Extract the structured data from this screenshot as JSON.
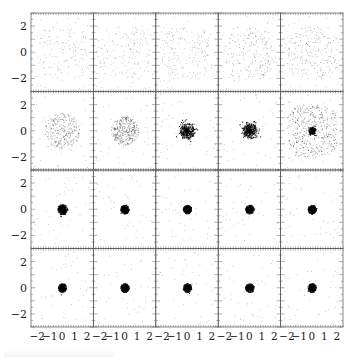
{
  "chart_data": {
    "type": "scatter",
    "layout": {
      "rows": 4,
      "cols": 5,
      "shared_axes": true
    },
    "xlim": [
      -2.5,
      2.5
    ],
    "ylim": [
      -3,
      3
    ],
    "xticks": [
      -2,
      -1,
      0,
      1,
      2
    ],
    "yticks": [
      -2,
      0,
      2
    ],
    "xtick_labels": [
      "−2",
      "−1",
      "0",
      "1",
      "2"
    ],
    "ytick_labels": [
      "−2",
      "0",
      "2"
    ],
    "title": "",
    "xlabel": "",
    "ylabel": "",
    "grid": false,
    "point_color": "#000000",
    "panels": [
      {
        "row": 0,
        "col": 0,
        "spread": 2.0,
        "core": 0.0,
        "density": 0.25
      },
      {
        "row": 0,
        "col": 1,
        "spread": 2.0,
        "core": 0.0,
        "density": 0.28
      },
      {
        "row": 0,
        "col": 2,
        "spread": 2.0,
        "core": 0.0,
        "density": 0.32
      },
      {
        "row": 0,
        "col": 3,
        "spread": 2.0,
        "core": 0.0,
        "density": 0.42
      },
      {
        "row": 0,
        "col": 4,
        "spread": 2.0,
        "core": 0.0,
        "density": 0.45
      },
      {
        "row": 1,
        "col": 0,
        "spread": 1.4,
        "core": 0.0,
        "density": 0.6
      },
      {
        "row": 1,
        "col": 1,
        "spread": 1.1,
        "core": 0.0,
        "density": 0.7
      },
      {
        "row": 1,
        "col": 2,
        "spread": 0.6,
        "core": 0.3,
        "density": 0.8
      },
      {
        "row": 1,
        "col": 3,
        "spread": 0.6,
        "core": 0.3,
        "density": 0.8
      },
      {
        "row": 1,
        "col": 4,
        "spread": 2.0,
        "core": 0.15,
        "density": 0.9
      },
      {
        "row": 2,
        "col": 0,
        "spread": 0.4,
        "core": 0.15,
        "density": 0.9
      },
      {
        "row": 2,
        "col": 1,
        "spread": 0.35,
        "core": 0.12,
        "density": 0.9
      },
      {
        "row": 2,
        "col": 2,
        "spread": 0.35,
        "core": 0.12,
        "density": 0.9
      },
      {
        "row": 2,
        "col": 3,
        "spread": 0.35,
        "core": 0.12,
        "density": 0.9
      },
      {
        "row": 2,
        "col": 4,
        "spread": 0.35,
        "core": 0.12,
        "density": 0.9
      },
      {
        "row": 3,
        "col": 0,
        "spread": 0.35,
        "core": 0.12,
        "density": 0.9
      },
      {
        "row": 3,
        "col": 1,
        "spread": 0.35,
        "core": 0.12,
        "density": 0.9
      },
      {
        "row": 3,
        "col": 2,
        "spread": 0.35,
        "core": 0.12,
        "density": 0.9
      },
      {
        "row": 3,
        "col": 3,
        "spread": 0.35,
        "core": 0.12,
        "density": 0.9
      },
      {
        "row": 3,
        "col": 4,
        "spread": 0.35,
        "core": 0.12,
        "density": 0.9
      }
    ]
  }
}
